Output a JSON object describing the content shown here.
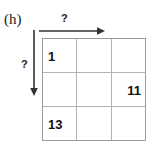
{
  "figure": {
    "panel_label": "(h)",
    "width": 152,
    "height": 155,
    "line_color": "#b3b3b3",
    "border_color": "#9a9a9a",
    "text_color": "#111111"
  },
  "axes": {
    "top": {
      "label": "?",
      "direction": "right",
      "arrow_color": "#333333"
    },
    "left": {
      "label": "?",
      "direction": "down",
      "arrow_color": "#333333"
    }
  },
  "grid": {
    "rows": 3,
    "cols": 3,
    "cells": [
      [
        {
          "value": "1",
          "align": "left"
        },
        {
          "value": "",
          "align": "left"
        },
        {
          "value": "",
          "align": "left"
        }
      ],
      [
        {
          "value": "",
          "align": "left"
        },
        {
          "value": "",
          "align": "left"
        },
        {
          "value": "11",
          "align": "right"
        }
      ],
      [
        {
          "value": "13",
          "align": "left"
        },
        {
          "value": "",
          "align": "left"
        },
        {
          "value": "",
          "align": "left"
        }
      ]
    ]
  }
}
